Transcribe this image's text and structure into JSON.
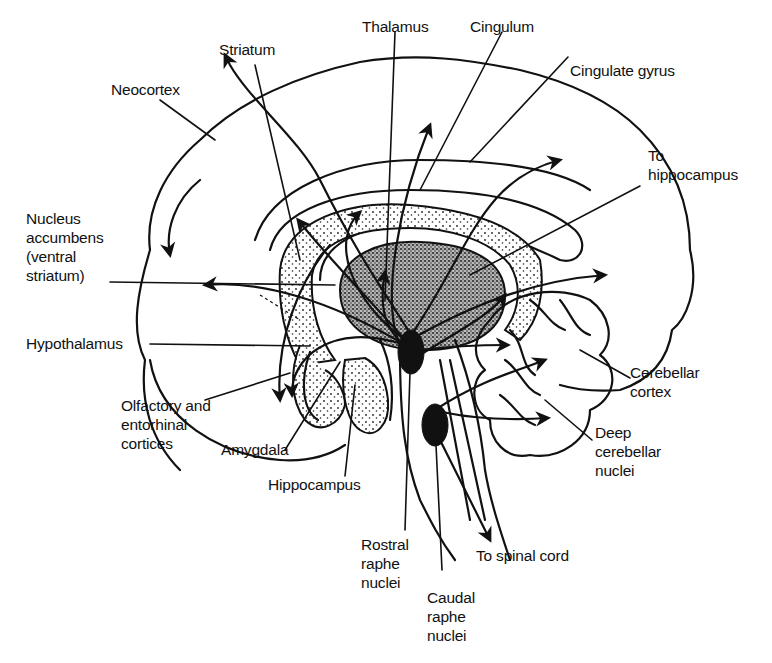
{
  "diagram": {
    "labels": {
      "thalamus": "Thalamus",
      "cingulum": "Cingulum",
      "striatum": "Striatum",
      "neocortex": "Neocortex",
      "cingulate_gyrus": "Cingulate gyrus",
      "to_hippocampus": "To\nhippocampus",
      "nucleus_accumbens": "Nucleus\naccumbens\n(ventral\nstriatum)",
      "hypothalamus": "Hypothalamus",
      "cerebellar_cortex": "Cerebellar\ncortex",
      "olfactory_entorhinal": "Olfactory and\nentorhinal\ncortices",
      "amygdala": "Amygdala",
      "deep_cerebellar_nuclei": "Deep\ncerebellar\nnuclei",
      "hippocampus": "Hippocampus",
      "rostral_raphe": "Rostral\nraphe\nnuclei",
      "to_spinal_cord": "To spinal cord",
      "caudal_raphe": "Caudal\nraphe\nnuclei"
    },
    "colors": {
      "ink": "#111111",
      "background": "#ffffff"
    }
  }
}
